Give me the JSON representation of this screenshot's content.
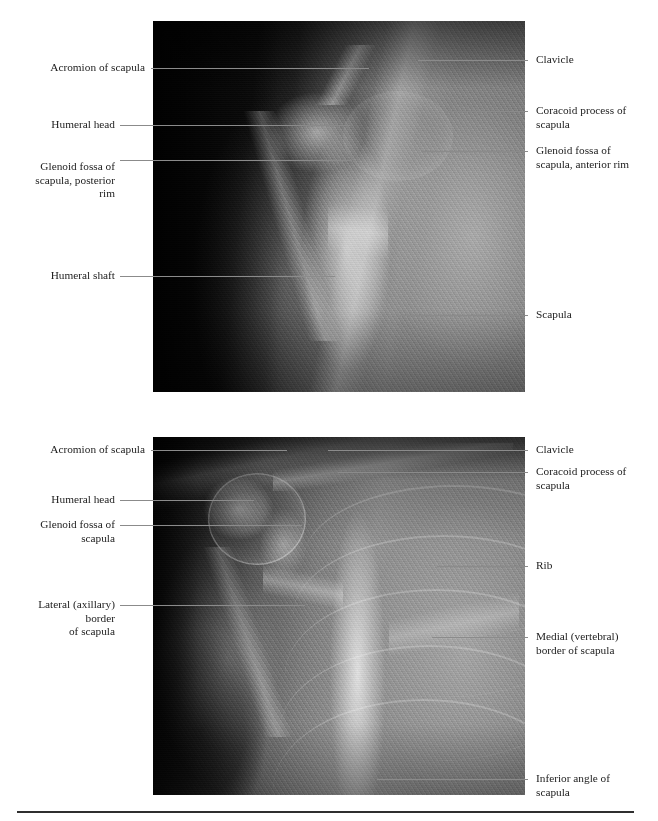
{
  "figure": {
    "panels": [
      {
        "id": "top",
        "view_name": "transscapular-lateral-shoulder-radiograph",
        "labels_left": [
          {
            "text": "Acromion of scapula",
            "name": "acromion-of-scapula"
          },
          {
            "text": "Humeral head",
            "name": "humeral-head"
          },
          {
            "text": "Glenoid fossa of\nscapula, posterior rim",
            "name": "glenoid-fossa-posterior-rim"
          },
          {
            "text": "Humeral shaft",
            "name": "humeral-shaft"
          }
        ],
        "labels_right": [
          {
            "text": "Clavicle",
            "name": "clavicle"
          },
          {
            "text": "Coracoid process of\nscapula",
            "name": "coracoid-process-of-scapula"
          },
          {
            "text": "Glenoid fossa of\nscapula, anterior rim",
            "name": "glenoid-fossa-anterior-rim"
          },
          {
            "text": "Scapula",
            "name": "scapula"
          }
        ]
      },
      {
        "id": "bottom",
        "view_name": "ap-shoulder-radiograph",
        "labels_left": [
          {
            "text": "Acromion of scapula",
            "name": "acromion-of-scapula"
          },
          {
            "text": "Humeral head",
            "name": "humeral-head"
          },
          {
            "text": "Glenoid fossa of\nscapula",
            "name": "glenoid-fossa-of-scapula"
          },
          {
            "text": "Lateral (axillary) border\nof scapula",
            "name": "lateral-axillary-border-of-scapula"
          }
        ],
        "labels_right": [
          {
            "text": "Clavicle",
            "name": "clavicle"
          },
          {
            "text": "Coracoid process of\nscapula",
            "name": "coracoid-process-of-scapula"
          },
          {
            "text": "Rib",
            "name": "rib"
          },
          {
            "text": "Medial (vertebral)\nborder of scapula",
            "name": "medial-vertebral-border-of-scapula"
          },
          {
            "text": "Inferior angle of\nscapula",
            "name": "inferior-angle-of-scapula"
          }
        ]
      }
    ],
    "colors": {
      "leader_line": "#8b8b8b",
      "text": "#1c1c1c",
      "rule": "#2f2f2f",
      "page_background": "#ffffff",
      "film_background": "#000000"
    }
  }
}
